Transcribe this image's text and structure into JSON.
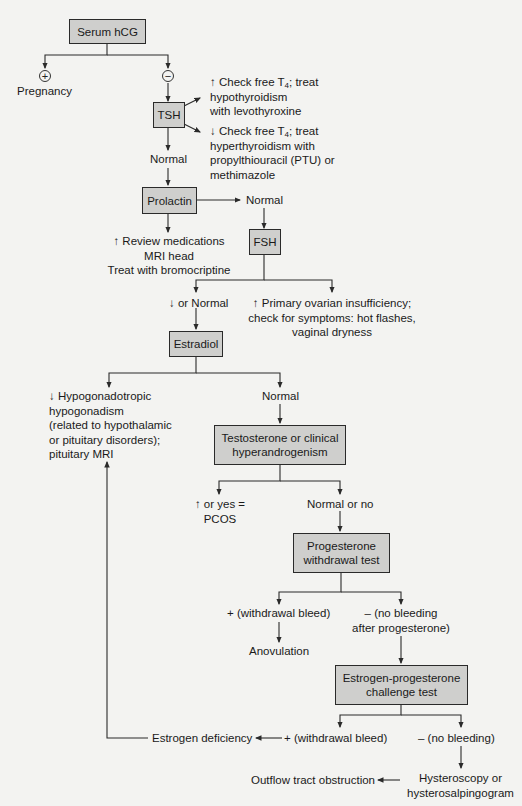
{
  "nodes": {
    "serum_hcg": "Serum hCG",
    "tsh": "TSH",
    "prolactin": "Prolactin",
    "fsh": "FSH",
    "estradiol": "Estradiol",
    "testosterone": [
      "Testosterone or clinical",
      "hyperandrogenism"
    ],
    "progesterone": [
      "Progesterone",
      "withdrawal test"
    ],
    "estrogen_progesterone": [
      "Estrogen-progesterone",
      "challenge test"
    ]
  },
  "signs": {
    "positive": "+",
    "negative": "−"
  },
  "labels": {
    "pregnancy": "Pregnancy",
    "tsh_high": [
      "↑ Check free T",
      "4",
      "; treat",
      "hypothyroidism",
      "with levothyroxine"
    ],
    "tsh_low": [
      "↓ Check free T",
      "4",
      "; treat",
      "hyperthyroidism with",
      "propylthiouracil (PTU) or",
      "methimazole"
    ],
    "tsh_normal": "Normal",
    "prolactin_normal": "Normal",
    "prolactin_high": [
      "↑ Review medications",
      "MRI head",
      "Treat with bromocriptine"
    ],
    "fsh_low_normal": "↓ or Normal",
    "fsh_high": [
      "↑ Primary ovarian insufficiency;",
      "check for symptoms: hot flashes,",
      "vaginal dryness"
    ],
    "estradiol_low": [
      "↓ Hypogonadotropic",
      "hypogonadism",
      "(related to hypothalamic",
      "or pituitary disorders);",
      "pituitary MRI"
    ],
    "estradiol_normal": "Normal",
    "testosterone_high": [
      "↑ or yes =",
      "PCOS"
    ],
    "testosterone_normal": "Normal or no",
    "progesterone_positive": "+ (withdrawal bleed)",
    "progesterone_negative": [
      "– (no bleeding",
      "after progesterone)"
    ],
    "anovulation": "Anovulation",
    "ep_positive": "+ (withdrawal bleed)",
    "ep_negative": "– (no bleeding)",
    "estrogen_deficiency": "Estrogen deficiency",
    "hysteroscopy": [
      "Hysteroscopy or",
      "hysterosalpingogram"
    ],
    "outflow_obstruction": "Outflow tract obstruction"
  },
  "colors": {
    "box_fill": "#cfcfcd",
    "line": "#2a2a2a",
    "background": "#f3f3f1"
  }
}
